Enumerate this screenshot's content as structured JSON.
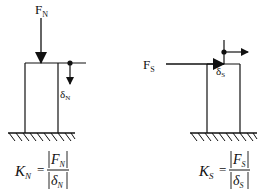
{
  "diagram": {
    "normal": {
      "force_label": "F",
      "force_sub": "N",
      "disp_label": "δ",
      "disp_sub": "N",
      "formula": {
        "lhs": "K",
        "lhs_sub": "N",
        "equals": "=",
        "num": "F",
        "num_sub": "N",
        "den": "δ",
        "den_sub": "N"
      }
    },
    "shear": {
      "force_label": "F",
      "force_sub": "S",
      "disp_label": "δ",
      "disp_sub": "S",
      "formula": {
        "lhs": "K",
        "lhs_sub": "S",
        "equals": "=",
        "num": "F",
        "num_sub": "S",
        "den": "δ",
        "den_sub": "S"
      }
    },
    "colors": {
      "ink": "#111111",
      "background": "#ffffff"
    }
  }
}
